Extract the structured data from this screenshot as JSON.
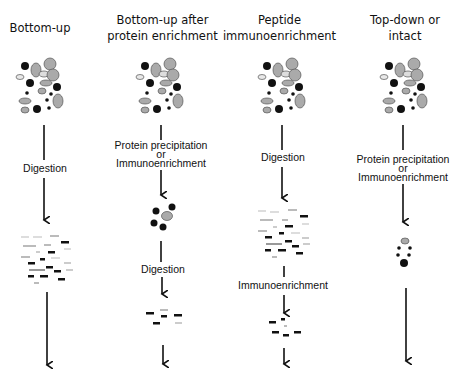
{
  "columns": [
    {
      "title_line1": "Bottom-up",
      "title_line2": "",
      "steps": [
        "Digestion"
      ]
    },
    {
      "title_line1": "Bottom-up after",
      "title_line2": "protein enrichment",
      "steps": [
        "Protein precipitation",
        "or",
        "Immunoenrichment",
        "Digestion"
      ]
    },
    {
      "title_line1": "Peptide",
      "title_line2": "immunoenrichment",
      "steps": [
        "Digestion",
        "Immunoenrichment"
      ]
    },
    {
      "title_line1": "Top-down or",
      "title_line2": "intact",
      "steps": [
        "Protein precipitation",
        "or",
        "Immunoenrichment"
      ]
    }
  ],
  "colors": {
    "black": "#111111",
    "gray": "#a8a8a8",
    "light": "#e4e4e4",
    "outline": "#555555"
  }
}
